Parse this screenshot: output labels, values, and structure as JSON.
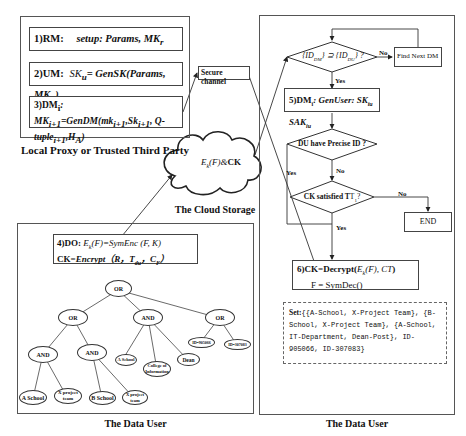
{
  "left_top_panel": {
    "caption": "Local Proxy or Trusted Third Party",
    "steps": [
      {
        "num": "1)RM:",
        "text": "setup: Params, MK",
        "sub": "r"
      },
      {
        "num": "2)UM:",
        "text_pre": "SK",
        "text_pre_sub": "u",
        "text": "= GenSK(Params, MK",
        "text_sub": "u",
        "text_post": ")"
      },
      {
        "num": "3)DM",
        "num_sub": "i",
        "text": ": MK",
        "line1": "MK_{i+1}=GenDM(mk_{i+1},Sk_{i+1}, Q-",
        "line2": "tuple_{i+1},H_A)"
      }
    ]
  },
  "secure_channel": {
    "label": "Secure channel"
  },
  "cloud": {
    "content": "E_k(F)&CK",
    "caption": "The Cloud Storage"
  },
  "left_bottom_panel": {
    "caption": "The Data User",
    "do_box": {
      "line1_label": "4)DO:",
      "line1_formula": "E_k(F)=SymEnc(F, K)",
      "line2_label": "CK=",
      "line2_formula": "Encrypt（R, T_du, C_F）"
    },
    "tree": {
      "root": "OR",
      "level1": [
        "OR",
        "AND",
        "OR"
      ],
      "level2_left": [
        "AND",
        "AND"
      ],
      "level2_mid": [
        "A School",
        "College of Information",
        "Dean"
      ],
      "level2_right": [
        "ID=905066",
        "ID=307083"
      ],
      "level3_and1": [
        "A School",
        "X project team"
      ],
      "level3_and2": [
        "B School",
        "X project team"
      ]
    }
  },
  "right_panel": {
    "caption": "The Data User",
    "decision1": {
      "text": "{ID_DM} ⊇ {ID_DU} ?",
      "no": "No",
      "yes": "Yes"
    },
    "find_next": "Find Next DM",
    "step5": {
      "label": "5)DM",
      "sub": "i",
      "text": ":  GenUser: SK",
      "sk_sub": "iu",
      "sak": " SAK",
      "sak_sub": "iu"
    },
    "decision2": {
      "text": "DU have Precise ID ?",
      "no": "No",
      "yes": "Yes"
    },
    "decision3": {
      "text": "CK satisfied T",
      "sub": "1",
      "post": "?",
      "no": "No",
      "yes": "Yes"
    },
    "end": "END",
    "step6": {
      "line1_label": "6)CK=Decrypt(",
      "line1_formula": "E_k(F), CT",
      "line1_close": ")",
      "line2": "F = SymDec()"
    },
    "set_box": {
      "label": "Set:",
      "text": "{{A-School, X-Project Team}, {B-School, X-Project Team}, {A-School, IT-Department, Dean-Post}, ID-905066, ID-307083}"
    }
  }
}
